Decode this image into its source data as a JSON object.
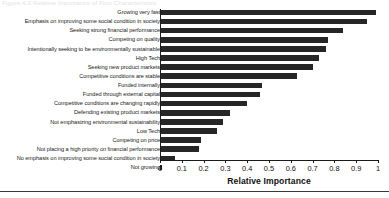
{
  "figure": {
    "caption_fragment": "Figure 4.2    Relative Importance of Firm Characteristics",
    "bottom_rule": true
  },
  "axis": {
    "title": "Relative Importance",
    "tick_labels": [
      "0",
      "0.1",
      "0.2",
      "0.3",
      "0.4",
      "0.5",
      "0.6",
      "0.7",
      "0.8",
      "0.9",
      "1"
    ],
    "min": 0,
    "max": 1
  },
  "colors": {
    "bar": "#262626",
    "axis": "#1a1a1a",
    "text": "#111111",
    "background": "#ffffff"
  },
  "chart_data": {
    "type": "bar",
    "orientation": "horizontal",
    "title": "",
    "xlabel": "Relative Importance",
    "ylabel": "",
    "xlim": [
      0,
      1
    ],
    "grid": false,
    "legend": false,
    "categories": [
      "Growing very fast",
      "Emphasis on improving some social condition in society",
      "Seeking strong financial performance",
      "Competing on quality",
      "Intentionally seeking to be environmentally sustainable",
      "High Tech",
      "Seeking new product markets",
      "Competitive conditions are stable",
      "Funded internally",
      "Funded through external capital",
      "Competitive conditions are changing rapidly",
      "Defending existing product markets",
      "Not emphasizing environmental sustainability",
      "Low Tech",
      "Competing on price",
      "Not placing a high priority on financial performance",
      "No emphasis on improving some social condition in society",
      "Not growing"
    ],
    "values": [
      0.99,
      0.95,
      0.84,
      0.77,
      0.76,
      0.73,
      0.7,
      0.63,
      0.47,
      0.46,
      0.4,
      0.32,
      0.29,
      0.26,
      0.19,
      0.18,
      0.07,
      0.01
    ]
  }
}
